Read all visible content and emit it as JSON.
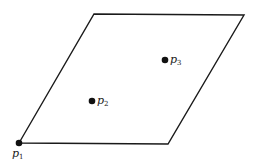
{
  "diagram": {
    "type": "parallelogram-with-points",
    "shape": {
      "vertices": [
        [
          19,
          143
        ],
        [
          94,
          14
        ],
        [
          244,
          15
        ],
        [
          168,
          144
        ]
      ],
      "stroke": "#1a1a1a"
    },
    "points": [
      {
        "name": "p1",
        "base": "p",
        "sub": "1",
        "x": 19,
        "y": 143,
        "label_x": 12,
        "label_y": 148
      },
      {
        "name": "p2",
        "base": "p",
        "sub": "2",
        "x": 92,
        "y": 101,
        "label_x": 97,
        "label_y": 95
      },
      {
        "name": "p3",
        "base": "p",
        "sub": "3",
        "x": 165,
        "y": 60,
        "label_x": 170,
        "label_y": 54
      }
    ]
  }
}
